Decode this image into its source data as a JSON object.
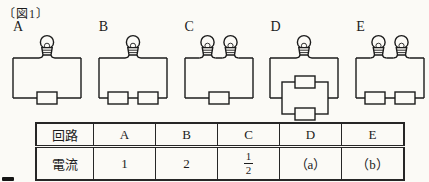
{
  "figure_label": "〔図1〕",
  "ink_color": "#1c1c1c",
  "paper_color": "#fbfaf6",
  "circuits": [
    {
      "label": "A",
      "bulbs": 1,
      "resistors": "single",
      "description": "one bulb, one resistor"
    },
    {
      "label": "B",
      "bulbs": 1,
      "resistors": "series2",
      "description": "one bulb, two resistors in series"
    },
    {
      "label": "C",
      "bulbs": 2,
      "resistors": "single",
      "description": "two bulbs in series, one resistor"
    },
    {
      "label": "D",
      "bulbs": 1,
      "resistors": "parallel2",
      "description": "one bulb, two resistors in parallel"
    },
    {
      "label": "E",
      "bulbs": 2,
      "resistors": "series2",
      "description": "two bulbs in series, two resistors in series"
    }
  ],
  "table": {
    "row_headers": [
      "回路",
      "電流"
    ],
    "columns": [
      "A",
      "B",
      "C",
      "D",
      "E"
    ],
    "current_values": [
      {
        "type": "text",
        "text": "1"
      },
      {
        "type": "text",
        "text": "2"
      },
      {
        "type": "fraction",
        "numerator": "1",
        "denominator": "2"
      },
      {
        "type": "text",
        "text": "（a）"
      },
      {
        "type": "text",
        "text": "（b）"
      }
    ]
  }
}
